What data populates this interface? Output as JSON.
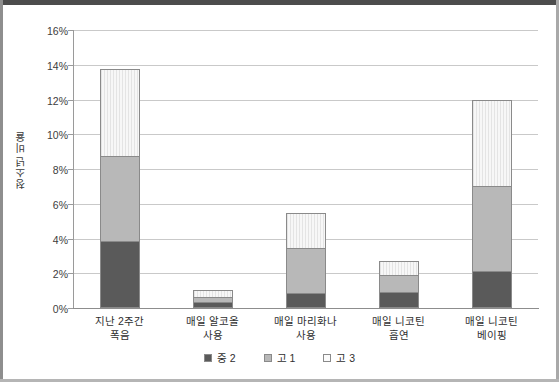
{
  "chart_data": {
    "type": "bar",
    "stacked": true,
    "title": "",
    "xlabel": "",
    "ylabel": "청소년 비율",
    "ylim": [
      0,
      16
    ],
    "ytick_step": 2,
    "ytick_labels": [
      "0%",
      "2%",
      "4%",
      "6%",
      "8%",
      "10%",
      "12%",
      "14%",
      "16%"
    ],
    "grid": true,
    "legend_position": "bottom",
    "categories": [
      "지난 2주간 폭음",
      "매일 알코올 사용",
      "매일 마리화나 사용",
      "매일 니코틴 흡연",
      "매일 니코틴 베이핑"
    ],
    "categories_lines": [
      [
        "지난 2주간",
        "폭음"
      ],
      [
        "매일 알코올",
        "사용"
      ],
      [
        "매일 마리화나",
        "사용"
      ],
      [
        "매일 니코틴",
        "흡연"
      ],
      [
        "매일 니코틴",
        "베이핑"
      ]
    ],
    "series": [
      {
        "name": "중 2",
        "color": "#5a5a5a",
        "values": [
          3.85,
          0.35,
          0.85,
          0.9,
          2.15
        ]
      },
      {
        "name": "고 1",
        "color": "#b8b8b8",
        "values": [
          4.95,
          0.35,
          2.65,
          1.05,
          4.95
        ]
      },
      {
        "name": "고 3",
        "color": "#f4f4f4",
        "values": [
          5.05,
          0.45,
          2.1,
          0.9,
          5.0
        ]
      }
    ],
    "totals": [
      13.85,
      1.15,
      5.6,
      2.85,
      12.1
    ]
  },
  "legend": {
    "items": [
      {
        "label": "중 2"
      },
      {
        "label": "고 1"
      },
      {
        "label": "고 3"
      }
    ]
  },
  "colors": {
    "series_dark": "#5a5a5a",
    "series_medium": "#b8b8b8",
    "series_light": "#f4f4f4",
    "gridline": "#c9c9c9",
    "axis": "#8d8d8d",
    "text": "#2f2f2f"
  }
}
